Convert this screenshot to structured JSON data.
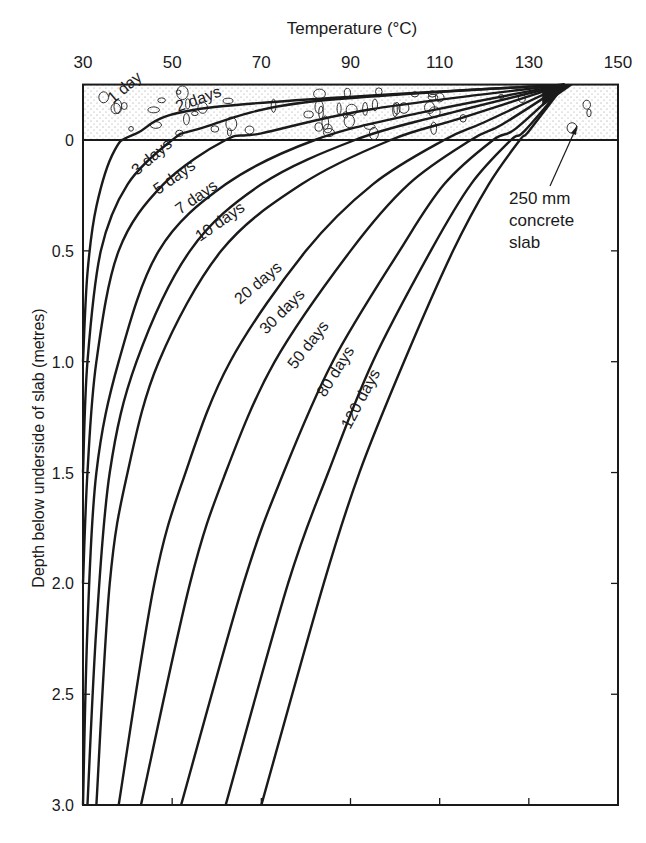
{
  "chart_data": {
    "type": "line",
    "title": "Temperature (°C)",
    "xlabel": "Temperature (°C)",
    "ylabel": "Depth below underside of slab (metres)",
    "x_axis_position": "top",
    "xlim": [
      30,
      150
    ],
    "ylim": [
      3.0,
      -0.25
    ],
    "x_ticks": [
      30,
      50,
      70,
      90,
      110,
      130,
      150
    ],
    "y_ticks": [
      "0",
      "0.5",
      "1.0",
      "1.5",
      "2.0",
      "2.5",
      "3.0"
    ],
    "grid": false,
    "legend": "inline curve labels",
    "annotation": {
      "line1": "250 mm",
      "line2": "concrete",
      "line3": "slab"
    },
    "slab": {
      "thickness_m": 0.25,
      "top_depth": -0.25,
      "bottom_depth": 0
    },
    "series": [
      {
        "name": "1 day",
        "label": "1 day",
        "points": [
          [
            138,
            -0.25
          ],
          [
            60,
            -0.15
          ],
          [
            42,
            -0.03
          ],
          [
            37,
            0.05
          ],
          [
            33,
            0.3
          ],
          [
            31,
            0.6
          ],
          [
            30,
            1.0
          ]
        ]
      },
      {
        "name": "2 days",
        "label": "2 days",
        "points": [
          [
            138,
            -0.25
          ],
          [
            80,
            -0.17
          ],
          [
            56,
            -0.05
          ],
          [
            50,
            0.0
          ],
          [
            40,
            0.2
          ],
          [
            34,
            0.5
          ],
          [
            31,
            1.0
          ],
          [
            30,
            1.5
          ]
        ]
      },
      {
        "name": "3 days",
        "label": "3 days",
        "points": [
          [
            138,
            -0.25
          ],
          [
            95,
            -0.14
          ],
          [
            70,
            -0.03
          ],
          [
            62,
            0.0
          ],
          [
            48,
            0.2
          ],
          [
            38,
            0.5
          ],
          [
            33,
            1.0
          ],
          [
            31,
            1.5
          ],
          [
            30,
            2.0
          ]
        ]
      },
      {
        "name": "5 days",
        "label": "5 days",
        "points": [
          [
            138,
            -0.25
          ],
          [
            105,
            -0.12
          ],
          [
            82,
            0.0
          ],
          [
            62,
            0.2
          ],
          [
            47,
            0.5
          ],
          [
            38,
            1.0
          ],
          [
            33,
            1.5
          ],
          [
            31,
            2.2
          ],
          [
            30,
            3.0
          ]
        ]
      },
      {
        "name": "7 days",
        "label": "7 days",
        "points": [
          [
            138,
            -0.25
          ],
          [
            110,
            -0.11
          ],
          [
            91,
            0.0
          ],
          [
            70,
            0.2
          ],
          [
            54,
            0.5
          ],
          [
            42,
            1.0
          ],
          [
            36,
            1.5
          ],
          [
            33,
            2.2
          ],
          [
            31,
            3.0
          ]
        ]
      },
      {
        "name": "10 days",
        "label": "10 days",
        "points": [
          [
            138,
            -0.25
          ],
          [
            115,
            -0.1
          ],
          [
            99,
            0.0
          ],
          [
            79,
            0.2
          ],
          [
            61,
            0.5
          ],
          [
            47,
            1.0
          ],
          [
            40,
            1.5
          ],
          [
            36,
            2.0
          ],
          [
            33,
            3.0
          ]
        ]
      },
      {
        "name": "20 days",
        "label": "20 days",
        "points": [
          [
            138,
            -0.25
          ],
          [
            120,
            -0.08
          ],
          [
            111,
            0.0
          ],
          [
            95,
            0.2
          ],
          [
            80,
            0.5
          ],
          [
            63,
            1.0
          ],
          [
            53,
            1.5
          ],
          [
            46,
            2.0
          ],
          [
            38,
            3.0
          ]
        ]
      },
      {
        "name": "30 days",
        "label": "30 days",
        "points": [
          [
            138,
            -0.25
          ],
          [
            124,
            -0.07
          ],
          [
            117,
            0.0
          ],
          [
            103,
            0.2
          ],
          [
            90,
            0.5
          ],
          [
            73,
            1.0
          ],
          [
            62,
            1.5
          ],
          [
            54,
            2.0
          ],
          [
            43,
            3.0
          ]
        ]
      },
      {
        "name": "50 days",
        "label": "50 days",
        "points": [
          [
            138,
            -0.25
          ],
          [
            127,
            -0.05
          ],
          [
            122,
            0.0
          ],
          [
            111,
            0.2
          ],
          [
            101,
            0.5
          ],
          [
            86,
            1.0
          ],
          [
            75,
            1.5
          ],
          [
            66,
            2.0
          ],
          [
            52,
            3.0
          ]
        ]
      },
      {
        "name": "80 days",
        "label": "80 days",
        "points": [
          [
            138,
            -0.25
          ],
          [
            129,
            -0.04
          ],
          [
            126,
            0.0
          ],
          [
            117,
            0.2
          ],
          [
            108,
            0.5
          ],
          [
            95,
            1.0
          ],
          [
            85,
            1.5
          ],
          [
            76,
            2.0
          ],
          [
            62,
            3.0
          ]
        ]
      },
      {
        "name": "120 days",
        "label": "120 days",
        "points": [
          [
            138,
            -0.25
          ],
          [
            130,
            -0.04
          ],
          [
            128,
            0.0
          ],
          [
            121,
            0.2
          ],
          [
            113,
            0.5
          ],
          [
            102,
            1.0
          ],
          [
            92,
            1.5
          ],
          [
            84,
            2.0
          ],
          [
            70,
            3.0
          ]
        ]
      }
    ]
  }
}
